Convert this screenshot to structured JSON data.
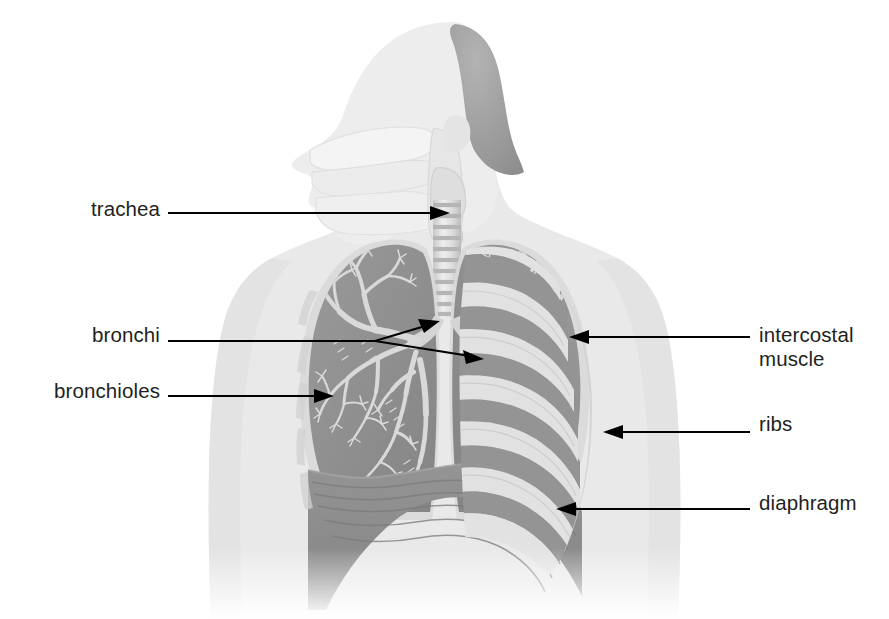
{
  "figure": {
    "caption_top": "",
    "background_color": "#ffffff"
  },
  "palette": {
    "body_silhouette": "#e9e9e9",
    "body_silhouette_edge": "#dddddd",
    "hair": "#9c9c9c",
    "lung_tissue": "#8f8f8f",
    "lung_tissue_dark": "#7d7d7d",
    "bronchial_tree": "#d8d8d8",
    "trachea_light": "#e3e3e3",
    "trachea_band": "#bdbdbd",
    "rib_bone": "#e0e0e0",
    "intercostal": "#9a9a9a",
    "diaphragm": "#8d8d8d",
    "diaphragm_stripe": "#7e7e7e",
    "label_text": "#231f20",
    "leader_line": "#000000"
  },
  "labels": [
    {
      "id": "trachea",
      "text": "trachea",
      "side": "left",
      "leader": "straight-arrow",
      "target": "trachea tube in neck"
    },
    {
      "id": "bronchi",
      "text": "bronchi",
      "side": "left",
      "leader": "forked-double-arrow",
      "target": "left and right primary bronchi"
    },
    {
      "id": "bronchioles",
      "text": "bronchioles",
      "side": "left",
      "leader": "straight-arrow",
      "target": "fine airway branches in left lung"
    },
    {
      "id": "intercostal-muscle",
      "text": "intercostal\nmuscle",
      "side": "right",
      "leader": "straight-arrow",
      "target": "muscle band between ribs"
    },
    {
      "id": "ribs",
      "text": "ribs",
      "side": "right",
      "leader": "straight-arrow",
      "target": "rib bone band"
    },
    {
      "id": "diaphragm",
      "text": "diaphragm",
      "side": "right",
      "leader": "straight-arrow",
      "target": "dome muscle below lungs"
    }
  ],
  "anatomy_parts": [
    {
      "name": "head-profile",
      "description": "human head shown in left-facing profile, pale silhouette"
    },
    {
      "name": "nasal-cavity",
      "description": "nasal passage inside head"
    },
    {
      "name": "oral-cavity",
      "description": "mouth cavity with tongue"
    },
    {
      "name": "pharynx",
      "description": "throat passage joining nose and mouth to larynx"
    },
    {
      "name": "larynx",
      "description": "voice box above the trachea"
    },
    {
      "name": "trachea",
      "description": "ringed windpipe tube descending into chest"
    },
    {
      "name": "left-bronchus",
      "description": "primary bronchus entering viewer-left lung"
    },
    {
      "name": "right-bronchus",
      "description": "primary bronchus entering viewer-right lung"
    },
    {
      "name": "left-lung",
      "description": "lung on viewer left with visible bronchial tree"
    },
    {
      "name": "right-lung",
      "description": "lung on viewer right partly covered by rib cage"
    },
    {
      "name": "bronchial-tree",
      "description": "branching airway network inside each lung"
    },
    {
      "name": "rib-cage",
      "description": "series of pale rib bands over the viewer-right chest"
    },
    {
      "name": "intercostal-muscles",
      "description": "darker bands filling the spaces between ribs"
    },
    {
      "name": "diaphragm",
      "description": "striated dome-shaped muscle sheet beneath the lungs"
    },
    {
      "name": "torso",
      "description": "shoulders and upper chest silhouette fading at bottom"
    }
  ]
}
